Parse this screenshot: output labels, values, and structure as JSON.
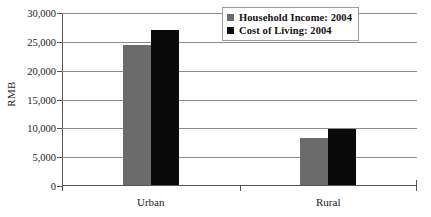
{
  "chart_data": {
    "type": "bar",
    "title": "",
    "xlabel": "",
    "ylabel": "RMB",
    "ylim": [
      0,
      30000
    ],
    "ytick_labels": [
      "30,000",
      "25,000",
      "20,000",
      "15,000",
      "10,000",
      "5,000",
      "0"
    ],
    "ytick_values": [
      30000,
      25000,
      20000,
      15000,
      10000,
      5000,
      0
    ],
    "grid": true,
    "legend_position": "top-right",
    "categories": [
      "Urban",
      "Rural"
    ],
    "series": [
      {
        "name": "Household Income: 2004",
        "color": "#6b6b6b",
        "values": [
          24200,
          8100
        ]
      },
      {
        "name": "Cost of Living: 2004",
        "color": "#0a0a0a",
        "values": [
          26800,
          9700
        ]
      }
    ]
  }
}
